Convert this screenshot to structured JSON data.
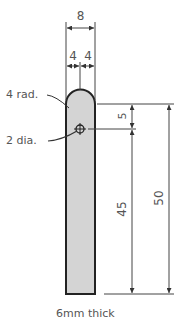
{
  "drawing": {
    "colors": {
      "part_fill": "#d4d4d4",
      "outline": "#222222",
      "dimension_line": "#444444",
      "text": "#555555",
      "background": "#ffffff"
    },
    "dimensions": {
      "overall_width": "8",
      "half_width_left": "4",
      "half_width_right": "4",
      "hole_to_top": "5",
      "hole_to_bottom": "45",
      "overall_length": "50"
    },
    "annotations": {
      "radius": "4 rad.",
      "hole": "2 dia.",
      "thickness": "6mm thick"
    }
  }
}
